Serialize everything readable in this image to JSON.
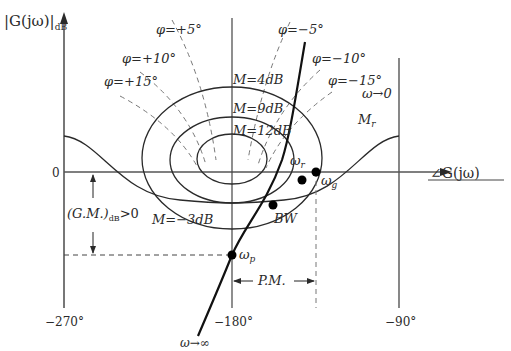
{
  "diagram": {
    "y_axis": {
      "label_main": "|G(jω)|",
      "label_sub": "dB",
      "zero_label": "0"
    },
    "x_axis": {
      "label": "∠G(jω)",
      "ticks": [
        "−270°",
        "−180°",
        "−90°"
      ]
    },
    "phase_contours": [
      {
        "label": "φ=+5°"
      },
      {
        "label": "φ=+10°"
      },
      {
        "label": "φ=+15°"
      },
      {
        "label": "φ=−5°"
      },
      {
        "label": "φ=−10°"
      },
      {
        "label": "φ=−15°"
      }
    ],
    "m_contours": [
      {
        "label": "M=4dB"
      },
      {
        "label": "M=9dB"
      },
      {
        "label": "M=12dB"
      },
      {
        "label": "M=−3dB"
      }
    ],
    "curve": {
      "start_label": "ω→0",
      "end_label": "ω→∞",
      "mr_label": "M",
      "mr_sub": "r"
    },
    "points": [
      {
        "name": "omega-r",
        "label": "ω",
        "sub": "r"
      },
      {
        "name": "omega-g",
        "label": "ω",
        "sub": "g"
      },
      {
        "name": "bandwidth",
        "label": "BW",
        "sub": ""
      },
      {
        "name": "omega-p",
        "label": "ω",
        "sub": "p"
      }
    ],
    "gain_margin": {
      "label": "(G.M.)",
      "sub": "dB",
      "suffix": ">0"
    },
    "phase_margin": {
      "label": "P.M."
    }
  }
}
